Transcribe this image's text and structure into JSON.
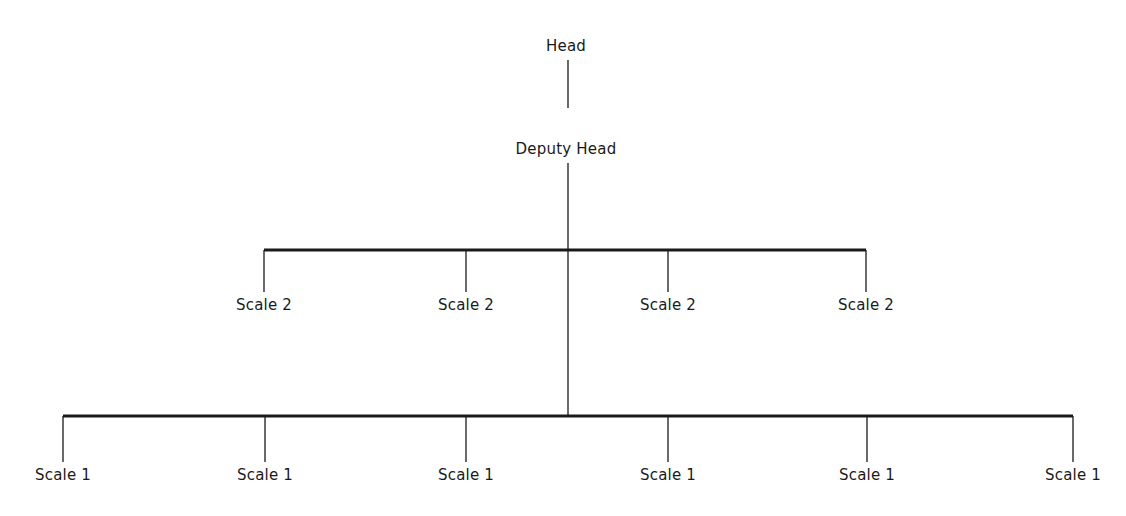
{
  "diagram": {
    "type": "org-chart",
    "line_color": "#1a1a1a",
    "background": "#ffffff",
    "head": {
      "label": "Head",
      "x": 566,
      "y": 46
    },
    "head_link": {
      "x": 568,
      "y1": 60,
      "y2": 108
    },
    "deputy": {
      "label": "Deputy Head",
      "x": 566,
      "y": 149
    },
    "trunk": {
      "x": 568,
      "y1": 163,
      "y2": 416
    },
    "tiers": [
      {
        "name": "scale-2",
        "bar": {
          "y": 250,
          "x1": 264,
          "x2": 866,
          "thickness": 3
        },
        "drop_end": 292,
        "label_y": 305,
        "nodes": [
          {
            "label": "Scale 2",
            "x": 264
          },
          {
            "label": "Scale 2",
            "x": 466
          },
          {
            "label": "Scale 2",
            "x": 668
          },
          {
            "label": "Scale 2",
            "x": 866
          }
        ]
      },
      {
        "name": "scale-1",
        "bar": {
          "y": 416,
          "x1": 63,
          "x2": 1073,
          "thickness": 3
        },
        "drop_end": 462,
        "label_y": 475,
        "nodes": [
          {
            "label": "Scale 1",
            "x": 63
          },
          {
            "label": "Scale 1",
            "x": 265
          },
          {
            "label": "Scale 1",
            "x": 466
          },
          {
            "label": "Scale 1",
            "x": 668
          },
          {
            "label": "Scale 1",
            "x": 867
          },
          {
            "label": "Scale 1",
            "x": 1073
          }
        ]
      }
    ]
  }
}
